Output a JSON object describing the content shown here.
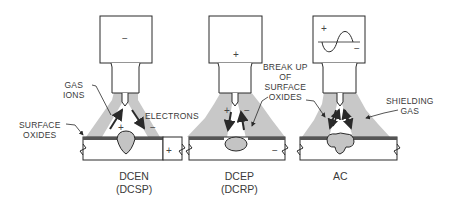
{
  "diagram": {
    "panels": [
      {
        "id": "dcen",
        "caption_line1": "DCEN",
        "caption_line2": "(DCSP)",
        "torch_polarity": "−",
        "left_arc_sign": "+",
        "right_arc_sign": "−",
        "plate_sign": "+",
        "labels": {
          "gas_ions": [
            "GAS",
            "IONS"
          ],
          "surface_oxides": [
            "SURFACE",
            "OXIDES"
          ],
          "electrons": "ELECTRONS"
        }
      },
      {
        "id": "dcep",
        "caption_line1": "DCEP",
        "caption_line2": "(DCRP)",
        "torch_polarity": "+",
        "left_arc_sign": "+",
        "right_arc_sign": "−",
        "plate_sign": "−",
        "labels": {
          "break_up": [
            "BREAK UP",
            "OF",
            "SURFACE",
            "OXIDES"
          ]
        }
      },
      {
        "id": "ac",
        "caption_line1": "AC",
        "torch_symbol": "sine-wave",
        "wave_plus": "+",
        "wave_minus": "−",
        "labels": {
          "shielding_gas": [
            "SHIELDING",
            "GAS"
          ]
        }
      }
    ],
    "colors": {
      "line": "#2a2a2a",
      "gas": "#c8c8c8",
      "weld_pool": "#c4c4c4",
      "oxide_layer": "#555555",
      "text": "#3a3a3a"
    }
  }
}
